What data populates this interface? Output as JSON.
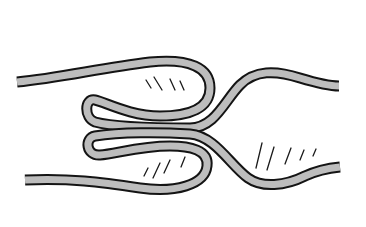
{
  "figure": {
    "colors": {
      "background": "#ffffff",
      "rope_fill": "#bdbdbd",
      "rope_outline": "#141414",
      "hatching": "#1a1a1a"
    },
    "rope_width": 9,
    "outline_width": 2
  }
}
